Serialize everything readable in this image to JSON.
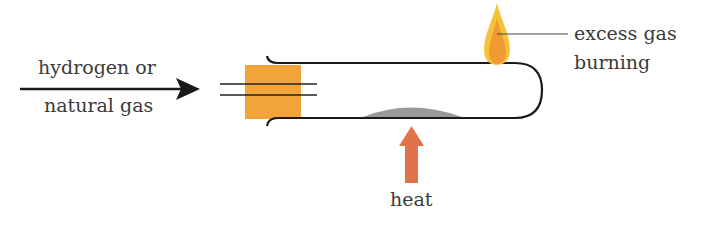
{
  "diagram": {
    "inlet_label": {
      "line1": "hydrogen or",
      "line2": "natural gas"
    },
    "flame_label": {
      "line1": "excess gas",
      "line2": "burning"
    },
    "heat_label": "heat"
  },
  "colors": {
    "stopper": "#f0a43a",
    "tube": "#1a1a1a",
    "powder": "#9a9a9a",
    "heat_arrow": "#e0734a",
    "flame_outer": "#f8c13a",
    "flame_inner": "#ef9a32",
    "text": "#3a3a3a"
  }
}
